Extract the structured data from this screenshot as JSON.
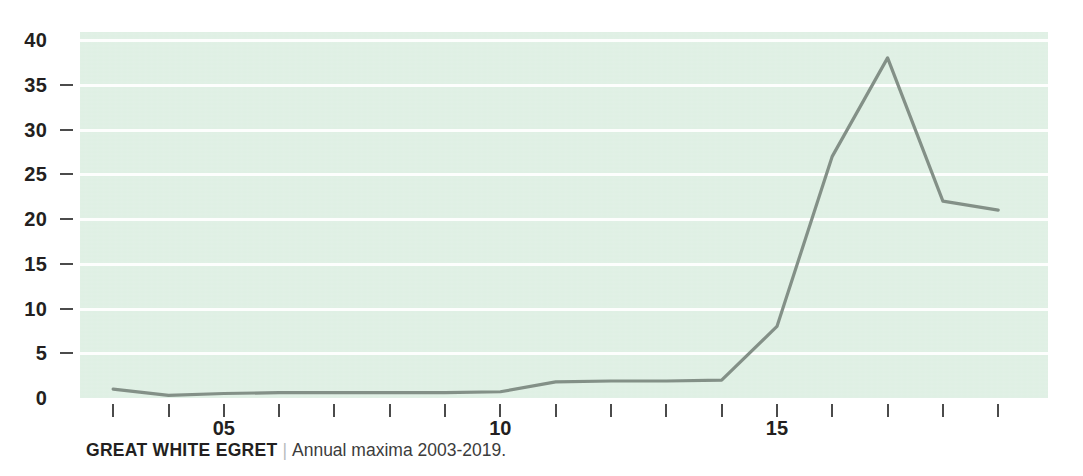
{
  "caption": {
    "title": "GREAT WHITE EGRET",
    "separator": "|",
    "subtitle": "Annual maxima 2003-2019."
  },
  "colors": {
    "plot_background": "#dff0e4",
    "gridline": "#ffffff",
    "line": "#7d8a82",
    "text": "#231f20",
    "tick": "#4b4b4b"
  },
  "chart_data": {
    "type": "line",
    "title": "GREAT WHITE EGRET",
    "subtitle": "Annual maxima 2003-2019.",
    "xlabel": "",
    "ylabel": "",
    "x": [
      3,
      4,
      5,
      6,
      7,
      8,
      9,
      10,
      11,
      12,
      13,
      14,
      15,
      16,
      17,
      18,
      19
    ],
    "values": [
      1,
      0.3,
      0.5,
      0.6,
      0.6,
      0.6,
      0.6,
      0.7,
      1.8,
      1.9,
      1.9,
      2.0,
      8,
      27,
      38,
      22,
      21
    ],
    "x_tick_labels": [
      "",
      "",
      "05",
      "",
      "",
      "",
      "",
      "10",
      "",
      "",
      "",
      "",
      "15",
      "",
      "",
      "",
      ""
    ],
    "y_ticks": [
      0,
      5,
      10,
      15,
      20,
      25,
      30,
      35,
      40
    ],
    "y_tick_labels": [
      "0",
      "5",
      "10",
      "15",
      "20",
      "25",
      "30",
      "35",
      "40"
    ],
    "xlim": [
      2.4,
      19.9
    ],
    "ylim": [
      0,
      40
    ],
    "grid": true,
    "grid_axis": "y",
    "legend": false
  }
}
